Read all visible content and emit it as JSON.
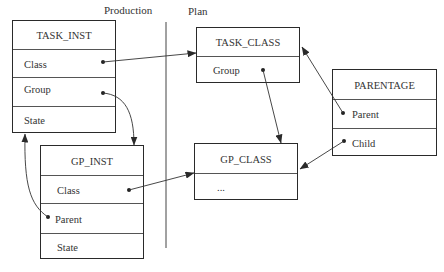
{
  "headings": {
    "production": "Production",
    "plan": "Plan"
  },
  "boxes": {
    "task_inst": {
      "title": "TASK_INST",
      "fields": [
        "Class",
        "Group",
        "State"
      ]
    },
    "gp_inst": {
      "title": "GP_INST",
      "fields": [
        "Class",
        "Parent",
        "State"
      ]
    },
    "task_class": {
      "title": "TASK_CLASS",
      "fields": [
        "Group"
      ]
    },
    "gp_class": {
      "title": "GP_CLASS",
      "fields": [
        "..."
      ]
    },
    "parentage": {
      "title": "PARENTAGE",
      "fields": [
        "Parent",
        "Child"
      ]
    }
  },
  "connections": [
    {
      "from": "TASK_INST.Class",
      "to": "TASK_CLASS"
    },
    {
      "from": "TASK_INST.Group",
      "to": "GP_INST"
    },
    {
      "from": "GP_INST.Class",
      "to": "GP_CLASS"
    },
    {
      "from": "GP_INST.Parent",
      "to": "TASK_INST"
    },
    {
      "from": "TASK_CLASS.Group",
      "to": "GP_CLASS"
    },
    {
      "from": "PARENTAGE.Parent",
      "to": "TASK_CLASS"
    },
    {
      "from": "PARENTAGE.Child",
      "to": "GP_CLASS"
    }
  ]
}
